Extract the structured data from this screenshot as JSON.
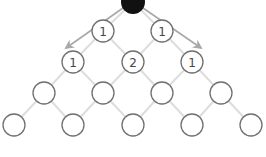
{
  "diagram": {
    "colors": {
      "background": "#ffffff",
      "node_stroke": "#707070",
      "edge": "#dddddd",
      "arrow": "#a8a8a8",
      "start_node": "#111111"
    },
    "start_node": {
      "x": 133,
      "y": 2,
      "r": 12
    },
    "arrows": [
      {
        "from": [
          123,
          8
        ],
        "to": [
          66,
          48
        ]
      },
      {
        "from": [
          143,
          8
        ],
        "to": [
          201,
          48
        ]
      }
    ],
    "rows": [
      {
        "y": 31,
        "nodes": [
          {
            "x": 103,
            "label": "1"
          },
          {
            "x": 162,
            "label": "1"
          }
        ]
      },
      {
        "y": 62,
        "nodes": [
          {
            "x": 73,
            "label": "1"
          },
          {
            "x": 133,
            "label": "2"
          },
          {
            "x": 192,
            "label": "1"
          }
        ]
      },
      {
        "y": 93,
        "nodes": [
          {
            "x": 44,
            "label": ""
          },
          {
            "x": 103,
            "label": ""
          },
          {
            "x": 162,
            "label": ""
          },
          {
            "x": 221,
            "label": ""
          }
        ]
      },
      {
        "y": 125,
        "nodes": [
          {
            "x": 14,
            "label": ""
          },
          {
            "x": 73,
            "label": ""
          },
          {
            "x": 133,
            "label": ""
          },
          {
            "x": 192,
            "label": ""
          },
          {
            "x": 251,
            "label": ""
          }
        ]
      }
    ],
    "node_radius": 11
  }
}
